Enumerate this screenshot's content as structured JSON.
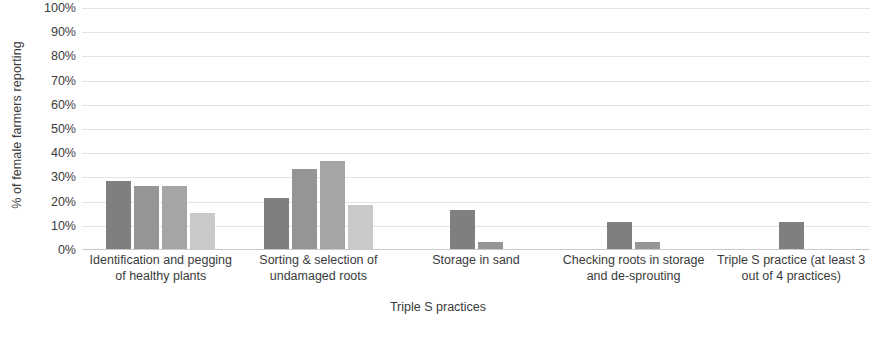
{
  "chart_data": {
    "type": "bar",
    "title": "",
    "subtitle": "",
    "xlabel": "Triple S practices",
    "ylabel": "% of female farmers reporting",
    "ylim": [
      0,
      100
    ],
    "ytick_labels": [
      "100%",
      "90%",
      "80%",
      "70%",
      "60%",
      "50%",
      "40%",
      "30%",
      "20%",
      "10%",
      "0%"
    ],
    "ytick_values": [
      100,
      90,
      80,
      70,
      60,
      50,
      40,
      30,
      20,
      10,
      0
    ],
    "grid": true,
    "legend": "none",
    "categories": [
      "Identification and pegging of healthy plants",
      "Sorting & selection of undamaged roots",
      "Storage in sand",
      "Checking roots in storage and de-sprouting",
      "Triple S practice (at least 3 out of 4 practices)"
    ],
    "groups": [
      {
        "category": "Identification and pegging of healthy plants",
        "bars": [
          {
            "value": 28,
            "color": "#7f7f7f"
          },
          {
            "value": 26,
            "color": "#959595"
          },
          {
            "value": 26,
            "color": "#a5a5a5"
          },
          {
            "value": 15,
            "color": "#c9c9c9"
          }
        ]
      },
      {
        "category": "Sorting & selection of undamaged roots",
        "bars": [
          {
            "value": 21,
            "color": "#7f7f7f"
          },
          {
            "value": 33,
            "color": "#959595"
          },
          {
            "value": 36.5,
            "color": "#a5a5a5"
          },
          {
            "value": 18,
            "color": "#c9c9c9"
          }
        ]
      },
      {
        "category": "Storage in sand",
        "bars": [
          {
            "value": 16,
            "color": "#7f7f7f"
          },
          {
            "value": 3,
            "color": "#959595"
          }
        ]
      },
      {
        "category": "Checking roots in storage and de-sprouting",
        "bars": [
          {
            "value": 11,
            "color": "#7f7f7f"
          },
          {
            "value": 3,
            "color": "#959595"
          }
        ]
      },
      {
        "category": "Triple S practice (at least 3 out of 4 practices)",
        "bars": [
          {
            "value": 11,
            "color": "#7f7f7f"
          }
        ]
      }
    ]
  }
}
